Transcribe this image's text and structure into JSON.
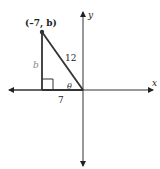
{
  "diagram": {
    "type": "coordinate-triangle",
    "axes": {
      "x_label": "x",
      "y_label": "y",
      "color": "#222222"
    },
    "point": {
      "label": "(–7, b)",
      "coords": [
        -7,
        "b"
      ]
    },
    "triangle": {
      "hypotenuse_label": "12",
      "vertical_leg_label": "b",
      "horizontal_leg_label": "7",
      "angle_label": "θ",
      "line_color": "#333333",
      "vertical_label_color": "#888888"
    }
  }
}
